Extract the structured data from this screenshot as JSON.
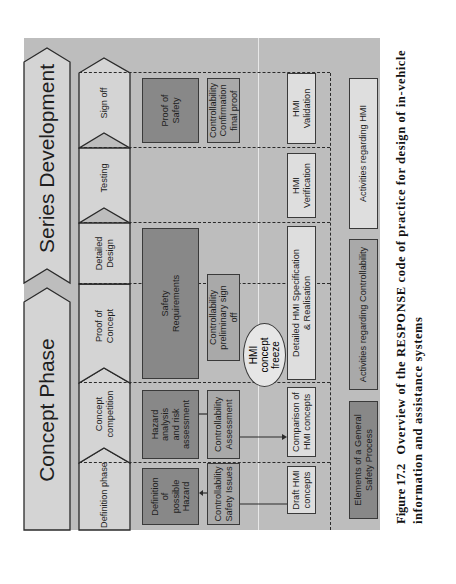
{
  "phases": [
    {
      "id": "concept",
      "label": "Concept Phase"
    },
    {
      "id": "series",
      "label": "Series Development"
    }
  ],
  "steps": [
    {
      "id": "definition",
      "label": "Definition phase"
    },
    {
      "id": "competition",
      "label": "Concept competition"
    },
    {
      "id": "proof",
      "label": "Proof of Concept"
    },
    {
      "id": "detailed",
      "label": "Detailed Design"
    },
    {
      "id": "testing",
      "label": "Testing"
    },
    {
      "id": "signoff",
      "label": "Sign off"
    }
  ],
  "safety": {
    "definition_hazard": "Definition of possible Hazard",
    "hazard_analysis": "Hazard analysis and risk assessment",
    "safety_requirements": "Safety Requirements",
    "proof_of_safety": "Proof of Safety"
  },
  "controllability": {
    "safety_issues": "Controllability Safety Issues",
    "assessment": "Controllability Assessment",
    "preliminary_signoff": "Controllability preliminary sign off",
    "final_proof": "Controllability Confirmation final proof"
  },
  "hmi": {
    "draft": "Draft HMI concepts",
    "comparison": "Comparison of HMI concepts",
    "freeze": "HMI concept freeze",
    "specification": "Detailed HMI Specification & Realisation",
    "verification": "HMI Verification",
    "validation": "HMI Validation"
  },
  "legend": {
    "safety": "Elements of a General Safety Process",
    "controllability": "Activities regarding Controllability",
    "hmi": "Activities regarding HMI"
  },
  "caption": {
    "number": "Figure 17.2",
    "text": "Overview of the RESPONSE code of practice for design of in-vehicle information and assistance systems"
  },
  "colors": {
    "frame": "#bdbdbd",
    "safety_block": "#888888",
    "controllability_block": "#a9a9a9",
    "hmi_block": "#dedede"
  }
}
